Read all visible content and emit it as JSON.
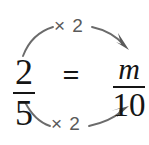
{
  "figure": {
    "background_color": "#ffffff",
    "text_color": "#151515",
    "arrow_color": "#5a5a5a"
  },
  "equation": {
    "left_fraction": {
      "numerator": "2",
      "denominator": "5"
    },
    "relation": "=",
    "right_fraction": {
      "numerator": "m",
      "denominator": "10"
    }
  },
  "annotations": {
    "top_arrow": {
      "label": "× 2",
      "direction": "numerator-to-numerator"
    },
    "bottom_arrow": {
      "label": "× 2",
      "direction": "denominator-to-denominator"
    }
  }
}
